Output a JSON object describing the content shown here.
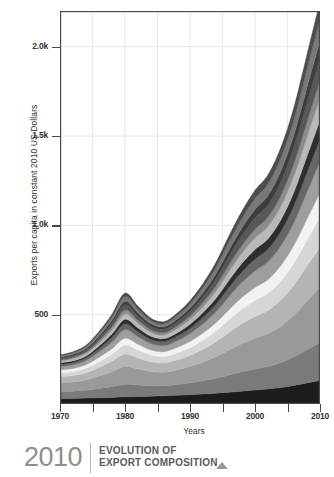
{
  "caption": {
    "year": "2010",
    "line1": "EVOLUTION OF",
    "line2": "EXPORT COMPOSITION",
    "marker_icon": "triangle-up-icon"
  },
  "axes": {
    "y_title": "Exports per capita in constant 2010 US Dollars",
    "x_title": "Years",
    "y_ticks": [
      {
        "value": 500,
        "label": "500"
      },
      {
        "value": 1000,
        "label": "1.0k"
      },
      {
        "value": 1500,
        "label": "1.5k"
      },
      {
        "value": 2000,
        "label": "2.0k"
      }
    ],
    "x_ticks": [
      {
        "value": 1970,
        "label": "1970"
      },
      {
        "value": 1975,
        "label": ""
      },
      {
        "value": 1980,
        "label": "1980"
      },
      {
        "value": 1985,
        "label": ""
      },
      {
        "value": 1990,
        "label": "1990"
      },
      {
        "value": 1995,
        "label": ""
      },
      {
        "value": 2000,
        "label": "2000"
      },
      {
        "value": 2005,
        "label": ""
      },
      {
        "value": 2010,
        "label": "2010"
      }
    ]
  },
  "colors": {
    "frame": "#4a4a4a",
    "text": "#333333",
    "caption_year": "#8f8f8f",
    "caption_text": "#5a5a5a",
    "caption_rule": "#b5b5b5",
    "marker": "#9a9a9a",
    "gridline": "#e8e8e8"
  },
  "chart_data": {
    "type": "area",
    "stacked": true,
    "title": "EVOLUTION OF EXPORT COMPOSITION",
    "xlabel": "Years",
    "ylabel": "Exports per capita in constant 2010 US Dollars",
    "xlim": [
      1970,
      2010
    ],
    "ylim": [
      0,
      2200
    ],
    "grid": true,
    "legend": "none",
    "x": [
      1970,
      1972,
      1974,
      1976,
      1978,
      1980,
      1982,
      1984,
      1986,
      1988,
      1990,
      1992,
      1994,
      1996,
      1998,
      2000,
      2002,
      2004,
      2006,
      2008,
      2010
    ],
    "series": [
      {
        "name": "layer-1",
        "color": "#1c1c1c",
        "values": [
          30,
          31,
          33,
          35,
          37,
          40,
          42,
          44,
          46,
          49,
          52,
          56,
          60,
          66,
          72,
          78,
          84,
          92,
          104,
          118,
          132
        ]
      },
      {
        "name": "layer-2",
        "color": "#7a7a7a",
        "values": [
          38,
          40,
          44,
          52,
          60,
          70,
          64,
          58,
          56,
          60,
          66,
          74,
          84,
          96,
          108,
          118,
          126,
          140,
          160,
          186,
          212
        ]
      },
      {
        "name": "layer-3",
        "color": "#999999",
        "values": [
          50,
          52,
          58,
          70,
          84,
          100,
          90,
          80,
          76,
          82,
          92,
          104,
          120,
          140,
          158,
          172,
          184,
          204,
          234,
          272,
          310
        ]
      },
      {
        "name": "layer-4",
        "color": "#b4b4b4",
        "values": [
          34,
          36,
          40,
          48,
          58,
          70,
          62,
          54,
          52,
          56,
          62,
          72,
          84,
          98,
          112,
          122,
          130,
          146,
          168,
          196,
          224
        ]
      },
      {
        "name": "layer-5",
        "color": "#d6d6d6",
        "values": [
          22,
          23,
          26,
          32,
          40,
          50,
          44,
          38,
          36,
          39,
          44,
          51,
          60,
          72,
          82,
          90,
          96,
          108,
          124,
          146,
          168
        ]
      },
      {
        "name": "layer-6",
        "color": "#f2f2f2",
        "values": [
          16,
          17,
          19,
          24,
          30,
          38,
          33,
          28,
          27,
          30,
          34,
          40,
          47,
          56,
          65,
          72,
          77,
          86,
          100,
          118,
          136
        ]
      },
      {
        "name": "layer-7",
        "color": "#9e9e9e",
        "values": [
          20,
          21,
          24,
          30,
          38,
          48,
          42,
          36,
          34,
          38,
          44,
          52,
          61,
          73,
          84,
          93,
          99,
          111,
          128,
          151,
          174
        ]
      },
      {
        "name": "layer-8",
        "color": "#676767",
        "values": [
          12,
          13,
          15,
          20,
          26,
          33,
          28,
          24,
          23,
          26,
          30,
          36,
          43,
          52,
          60,
          67,
          72,
          81,
          94,
          111,
          128
        ]
      },
      {
        "name": "layer-9",
        "color": "#2e2e2e",
        "values": [
          8,
          9,
          10,
          14,
          19,
          25,
          21,
          17,
          16,
          18,
          22,
          27,
          33,
          40,
          47,
          53,
          57,
          64,
          75,
          89,
          103
        ]
      },
      {
        "name": "layer-10",
        "color": "#b9b9b9",
        "values": [
          10,
          11,
          13,
          17,
          23,
          30,
          25,
          21,
          20,
          23,
          27,
          33,
          40,
          49,
          57,
          64,
          69,
          78,
          91,
          108,
          125
        ]
      },
      {
        "name": "layer-11",
        "color": "#8c8c8c",
        "values": [
          7,
          8,
          9,
          12,
          17,
          22,
          18,
          15,
          14,
          16,
          20,
          24,
          30,
          37,
          43,
          49,
          53,
          60,
          70,
          83,
          97
        ]
      },
      {
        "name": "layer-12",
        "color": "#585858",
        "values": [
          9,
          10,
          12,
          16,
          22,
          29,
          24,
          20,
          19,
          22,
          26,
          32,
          39,
          48,
          57,
          64,
          69,
          78,
          92,
          110,
          128
        ]
      },
      {
        "name": "layer-13",
        "color": "#3d3d3d",
        "values": [
          6,
          7,
          8,
          11,
          15,
          20,
          17,
          14,
          13,
          15,
          18,
          22,
          28,
          35,
          41,
          47,
          51,
          58,
          68,
          82,
          96
        ]
      },
      {
        "name": "layer-14",
        "color": "#787878",
        "values": [
          8,
          9,
          11,
          15,
          20,
          27,
          22,
          18,
          17,
          20,
          24,
          30,
          37,
          46,
          54,
          61,
          66,
          75,
          88,
          106,
          124
        ]
      },
      {
        "name": "layer-15",
        "color": "#4d4d4d",
        "values": [
          5,
          6,
          7,
          10,
          14,
          19,
          16,
          13,
          12,
          14,
          17,
          21,
          27,
          34,
          40,
          46,
          50,
          57,
          67,
          81,
          96
        ]
      }
    ]
  }
}
